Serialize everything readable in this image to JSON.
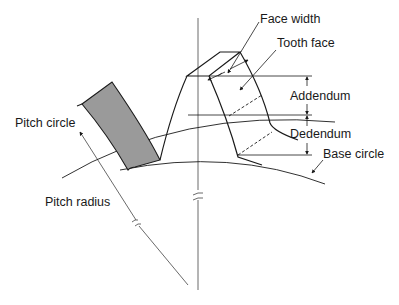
{
  "diagram": {
    "type": "gear tooth nomenclature",
    "labels": {
      "face_width": "Face width",
      "tooth_face": "Tooth face",
      "addendum": "Addendum",
      "dedendum": "Dedendum",
      "pitch_circle": "Pitch circle",
      "base_circle": "Base circle",
      "pitch_radius": "Pitch radius"
    },
    "colors": {
      "line": "#1a1a1a",
      "shaded_tooth": "#9a9a9a",
      "background": "#ffffff"
    }
  }
}
